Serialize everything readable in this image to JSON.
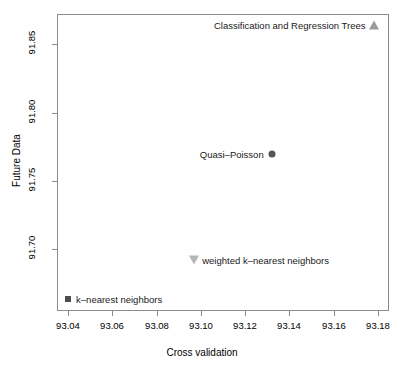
{
  "chart_data": {
    "type": "scatter",
    "title": "",
    "xlabel": "Cross validation",
    "ylabel": "Future Data",
    "xlim": [
      93.035,
      93.185
    ],
    "ylim": [
      91.655,
      91.872
    ],
    "grid": false,
    "legend": "none (points labelled in place)",
    "xticks": [
      "93.04",
      "93.06",
      "93.08",
      "93.10",
      "93.12",
      "93.14",
      "93.16",
      "93.18"
    ],
    "xtick_values": [
      93.04,
      93.06,
      93.08,
      93.1,
      93.12,
      93.14,
      93.16,
      93.18
    ],
    "yticks": [
      "91.70",
      "91.75",
      "91.80",
      "91.85"
    ],
    "ytick_values": [
      91.7,
      91.75,
      91.8,
      91.85
    ],
    "points": [
      {
        "label": "Classification and Regression Trees",
        "x": 93.178,
        "y": 91.864,
        "marker": "triangle-up",
        "color": "#9a9a9a",
        "label_side": "left"
      },
      {
        "label": "Quasi–Poisson",
        "x": 93.132,
        "y": 91.77,
        "marker": "circle",
        "color": "#555555",
        "label_side": "left"
      },
      {
        "label": "weighted k–nearest neighbors",
        "x": 93.097,
        "y": 91.692,
        "marker": "triangle-down",
        "color": "#b5b5b5",
        "label_side": "right"
      },
      {
        "label": "k–nearest neighbors",
        "x": 93.04,
        "y": 91.664,
        "marker": "square",
        "color": "#4d4d4d",
        "label_side": "right"
      }
    ]
  },
  "axes": {
    "x_title": "Cross validation",
    "y_title": "Future Data"
  },
  "colors": {
    "frame": "#8c8c8c",
    "background": "#ffffff",
    "text": "#000000"
  }
}
